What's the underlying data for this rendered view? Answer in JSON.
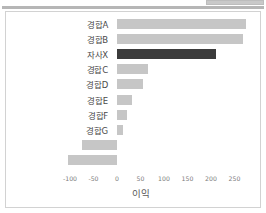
{
  "window": {
    "top_tab_label": "",
    "divider": ""
  },
  "chart_data": {
    "type": "bar",
    "orientation": "horizontal",
    "title": "",
    "xlabel": "이익",
    "ylabel": "",
    "categories": [
      "경합A",
      "경합B",
      "자사X",
      "경합C",
      "경합D",
      "경합E",
      "경합F",
      "경합G",
      "경합H",
      "경합I"
    ],
    "values": [
      275,
      268,
      210,
      65,
      55,
      32,
      22,
      12,
      -75,
      -105
    ],
    "xlim": [
      -120,
      285
    ],
    "xticks": [
      -100,
      -50,
      0,
      50,
      100,
      150,
      200,
      250
    ],
    "xticklabels": [
      "-100",
      "-50",
      "0",
      "50",
      "100",
      "150",
      "200",
      "250"
    ],
    "grid": false,
    "legend": null,
    "colors": {
      "default_bar": "#c6c6c6",
      "highlight_bar": "#3b3b3b",
      "highlight_category": "자사X",
      "axis_text": "#7d7d7d",
      "label_text": "#4a4a4a",
      "card_border": "#d2d2d2",
      "background": "#ffffff"
    }
  }
}
